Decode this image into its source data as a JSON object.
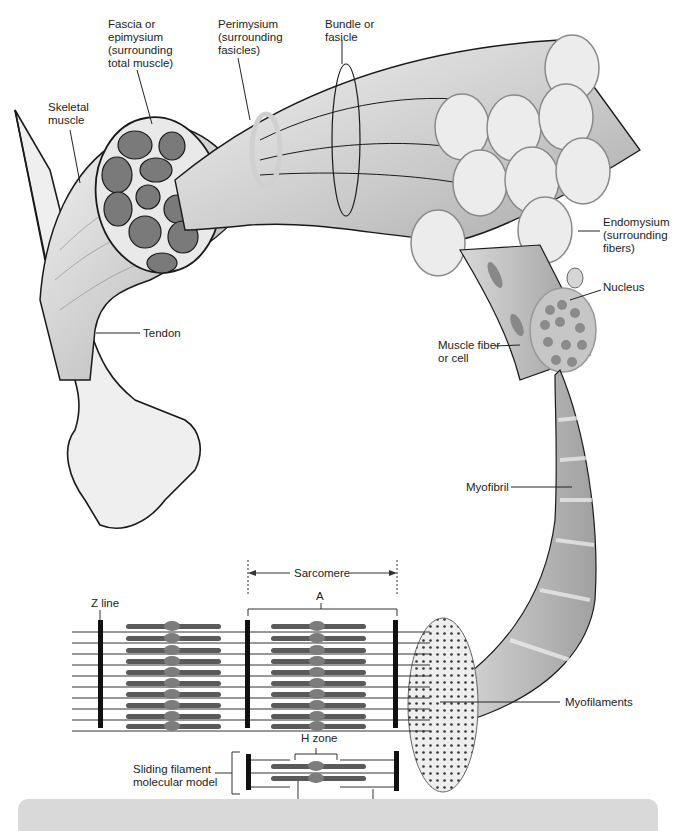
{
  "diagram": {
    "labels": {
      "fascia": "Fascia or\nepimysium\n(surrounding\ntotal muscle)",
      "perimysium": "Perimysium\n(surrounding\nfasicles)",
      "bundle": "Bundle or\nfasicle",
      "skeletal_muscle": "Skeletal\nmuscle",
      "endomysium": "Endomysium\n(surrounding\nfibers)",
      "nucleus": "Nucleus",
      "tendon": "Tendon",
      "muscle_fiber": "Muscle fiber\nor cell",
      "myofibril": "Myofibril",
      "sarcomere": "Sarcomere",
      "a_band": "A",
      "z_line": "Z line",
      "myofilaments": "Myofilaments",
      "h_zone": "H zone",
      "sliding_model": "Sliding filament\nmolecular model",
      "myosin": "Myosin",
      "actin": "Actin"
    },
    "colors": {
      "outline": "#1a1a1a",
      "fascicle_fill": "#7a7a7a",
      "muscle_light": "#e6e6e6",
      "muscle_mid": "#bdbdbd",
      "bone": "#efefef",
      "band": "#d9d9d9",
      "myosin": "#5a5a5a"
    }
  }
}
